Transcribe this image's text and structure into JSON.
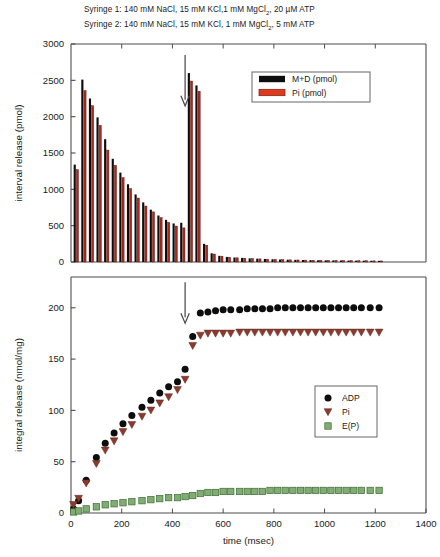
{
  "caption": {
    "line1_pre": "Syringe 1: 140 mM NaCl, 15 mM KCl,1 mM MgCl",
    "line1_sub": "2",
    "line1_post": ", 20 µM ATP",
    "line2_pre": "Syringe 2: 140 mM NaCl, 15 mM KCl, 1 mM MgCl",
    "line2_sub": "2",
    "line2_post": ", 5 mM ATP"
  },
  "colors": {
    "black": "#0d0d0d",
    "red": "#b3261a",
    "dark_red": "#8d3a2e",
    "green": "#7fad72",
    "green_edge": "#3f6b36",
    "axis": "#4d4d4d",
    "arrow": "#4a4a4a"
  },
  "axes": {
    "x_label": "time (msec)",
    "x_ticks": [
      "0",
      "200",
      "400",
      "600",
      "800",
      "1000",
      "1200",
      "1400"
    ],
    "x_min": 0,
    "x_max": 1400,
    "top_y_label": "interval release (pmol)",
    "top_y_ticks": [
      "0",
      "500",
      "1000",
      "1500",
      "2000",
      "2500",
      "3000"
    ],
    "top_y_min": 0,
    "top_y_max": 3000,
    "bottom_y_label": "integral release (nmol/mg)",
    "bottom_y_ticks": [
      "0",
      "50",
      "100",
      "150",
      "200"
    ],
    "bottom_y_min": 0,
    "bottom_y_max": 230
  },
  "legends": {
    "top": [
      {
        "label": "M+D (pmol)",
        "marker": "bar",
        "color": "#0d0d0d"
      },
      {
        "label": "Pi (pmol)",
        "marker": "bar",
        "color": "#e03a1e"
      }
    ],
    "bottom": [
      {
        "label": "ADP",
        "marker": "circle",
        "color": "#0d0d0d"
      },
      {
        "label": "Pi",
        "marker": "triangle-down",
        "color": "#8d3a2e"
      },
      {
        "label": "E(P)",
        "marker": "square",
        "color": "#7fad72"
      }
    ]
  },
  "annotations": {
    "top_arrow": {
      "x": 450,
      "y_from": 2850,
      "y_to": 2150,
      "shape": "down-arrow"
    },
    "bottom_arrow": {
      "x": 450,
      "y_from": 225,
      "y_to": 185,
      "shape": "down-arrow"
    }
  },
  "chart_data": [
    {
      "type": "bar",
      "title": "interval release",
      "xlabel": "",
      "ylabel": "interval release (pmol)",
      "xlim": [
        0,
        1400
      ],
      "ylim": [
        0,
        3000
      ],
      "grid": false,
      "legend_position": "upper-right",
      "x": [
        20,
        50,
        80,
        110,
        140,
        170,
        200,
        230,
        260,
        290,
        320,
        350,
        380,
        410,
        440,
        470,
        500,
        530,
        560,
        590,
        620,
        650,
        680,
        710,
        740,
        770,
        800,
        830,
        860,
        890,
        920,
        950,
        980,
        1010,
        1040,
        1070,
        1100,
        1130,
        1160,
        1190,
        1220
      ],
      "series": [
        {
          "name": "M+D (pmol)",
          "color": "#0d0d0d",
          "values": [
            1340,
            2510,
            2250,
            1990,
            1690,
            1420,
            1230,
            1070,
            930,
            820,
            720,
            640,
            580,
            530,
            540,
            2600,
            2430,
            250,
            120,
            85,
            70,
            62,
            56,
            50,
            46,
            42,
            38,
            35,
            32,
            30,
            28,
            26,
            24,
            23,
            22,
            21,
            20,
            19,
            18,
            17,
            16
          ]
        },
        {
          "name": "Pi (pmol)",
          "color": "#b3261a",
          "values": [
            1270,
            2360,
            2150,
            1880,
            1540,
            1330,
            1160,
            1010,
            880,
            770,
            690,
            610,
            545,
            495,
            470,
            2490,
            2350,
            230,
            110,
            80,
            66,
            58,
            52,
            47,
            43,
            39,
            36,
            33,
            30,
            28,
            26,
            24,
            23,
            22,
            21,
            20,
            19,
            18,
            17,
            16,
            15
          ]
        }
      ]
    },
    {
      "type": "scatter",
      "title": "integral release",
      "xlabel": "time (msec)",
      "ylabel": "integral release (nmol/mg)",
      "xlim": [
        0,
        1400
      ],
      "ylim": [
        0,
        230
      ],
      "grid": false,
      "legend_position": "lower-right",
      "x": [
        10,
        30,
        60,
        100,
        135,
        170,
        205,
        240,
        280,
        315,
        350,
        385,
        420,
        450,
        480,
        510,
        540,
        570,
        600,
        630,
        665,
        695,
        725,
        755,
        785,
        815,
        845,
        875,
        905,
        935,
        965,
        995,
        1025,
        1055,
        1085,
        1115,
        1145,
        1180,
        1215
      ],
      "series": [
        {
          "name": "ADP",
          "marker": "circle",
          "color": "#0d0d0d",
          "values": [
            4,
            12,
            32,
            54,
            68,
            78,
            87,
            95,
            103,
            110,
            117,
            123,
            128,
            140,
            172,
            195,
            196,
            197,
            198,
            198,
            198,
            199,
            199,
            199,
            199,
            200,
            200,
            200,
            200,
            200,
            200,
            200,
            200,
            200,
            200,
            200,
            200,
            200,
            200
          ]
        },
        {
          "name": "Pi",
          "marker": "triangle-down",
          "color": "#8d3a2e",
          "values": [
            8,
            14,
            29,
            48,
            61,
            70,
            79,
            86,
            94,
            100,
            107,
            113,
            120,
            130,
            163,
            173,
            175,
            175,
            175,
            175,
            176,
            176,
            176,
            176,
            176,
            176,
            176,
            176,
            176,
            176,
            176,
            176,
            176,
            176,
            176,
            176,
            176,
            176,
            176
          ]
        },
        {
          "name": "E(P)",
          "marker": "square",
          "color": "#7fad72",
          "values": [
            1,
            2,
            4,
            6,
            8,
            9,
            10,
            11,
            12,
            13,
            14,
            15,
            15,
            16,
            17,
            19,
            20,
            20,
            21,
            21,
            21,
            21,
            21,
            21,
            22,
            22,
            22,
            22,
            22,
            22,
            22,
            22,
            22,
            22,
            22,
            22,
            22,
            22,
            22
          ]
        }
      ]
    }
  ]
}
